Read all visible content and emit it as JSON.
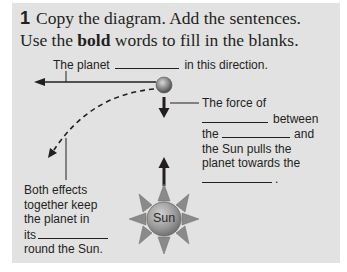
{
  "exercise": {
    "number": "1",
    "instruction_line1": "Copy the diagram. Add the sentences.",
    "instruction_line2_pre": "Use the ",
    "instruction_line2_bold": "bold",
    "instruction_line2_post": " words to fill in the blanks."
  },
  "diagram": {
    "top_label": {
      "pre": "The planet",
      "post": "in this direction."
    },
    "force_label": {
      "line1": "The force of",
      "line2_post": "between",
      "line3_pre": "the",
      "line3_post": "and",
      "line4": "the Sun pulls the",
      "line5": "planet towards the",
      "line6_post": "."
    },
    "effects_label": {
      "line1": "Both effects",
      "line2": "together keep",
      "line3": "the planet in",
      "line4_pre": "its",
      "line5": "round the Sun."
    },
    "sun_label": "Sun"
  },
  "colors": {
    "panel": "#e2e2e2",
    "text": "#231f20",
    "sun_ray": "#8a8a8a",
    "sun_body": "#9a9a9a"
  }
}
